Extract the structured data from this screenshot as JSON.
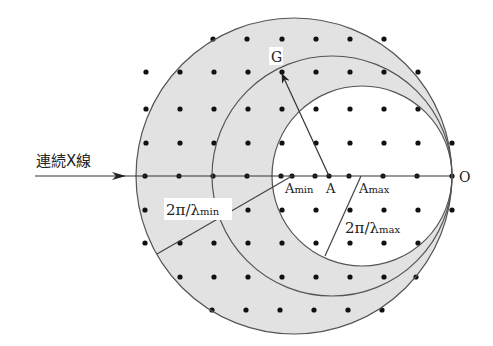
{
  "colors": {
    "background": "#ffffff",
    "shell_fill": "#e2e2e2",
    "line": "#444444",
    "dot": "#111111"
  },
  "labels": {
    "incident": "連続X線",
    "G": "G",
    "O": "O",
    "A": "A",
    "Amin": "A",
    "Amin_sub": "min",
    "Amax": "A",
    "Amax_sub": "max",
    "radius_min": "2π/λ",
    "radius_min_sub": "min",
    "radius_max": "2π/λ",
    "radius_max_sub": "max"
  },
  "geometry": {
    "axis_y": 176,
    "origin_O": [
      452,
      176
    ],
    "incident_start_x": 35,
    "spheres": [
      {
        "name": "lambda-min-sphere",
        "center": "Amin",
        "cx": 294,
        "r": 158
      },
      {
        "name": "lambda-mid-sphere",
        "center": "A",
        "cx": 332,
        "r": 120
      },
      {
        "name": "lambda-max-sphere",
        "center": "Amax",
        "cx": 362,
        "r": 90
      }
    ],
    "points": {
      "Amin": [
        292,
        176
      ],
      "A": [
        329,
        176
      ],
      "Amax": [
        361,
        176
      ],
      "G": [
        281,
        72
      ]
    },
    "radius_lines": {
      "min": {
        "from": [
          292,
          176
        ],
        "to": [
          157,
          254
        ]
      },
      "max": {
        "from": [
          361,
          176
        ],
        "to": [
          325,
          256
        ]
      }
    }
  },
  "lattice": {
    "spacing": 34,
    "rows": [
      {
        "y": 39,
        "xs": [
          213,
          247,
          282,
          316,
          350,
          384
        ]
      },
      {
        "y": 72,
        "xs": [
          146,
          180,
          214,
          248,
          282,
          316,
          350,
          384,
          418
        ]
      },
      {
        "y": 109,
        "xs": [
          146,
          180,
          214,
          248,
          282,
          316,
          350,
          384,
          418
        ]
      },
      {
        "y": 143,
        "xs": [
          146,
          180,
          214,
          248,
          282,
          316,
          350,
          384,
          418,
          452
        ]
      },
      {
        "y": 176,
        "xs": [
          145,
          179,
          213,
          247,
          281,
          292,
          315,
          329,
          349,
          383,
          417,
          452
        ]
      },
      {
        "y": 210,
        "xs": [
          145,
          180,
          214,
          248,
          282,
          316,
          350,
          384,
          418,
          452
        ]
      },
      {
        "y": 243,
        "xs": [
          145,
          180,
          214,
          248,
          282,
          316,
          350,
          384,
          418
        ]
      },
      {
        "y": 277,
        "xs": [
          180,
          214,
          248,
          282,
          316,
          350,
          384,
          416
        ]
      },
      {
        "y": 310,
        "xs": [
          212,
          246,
          280,
          314,
          348,
          382
        ]
      }
    ]
  }
}
